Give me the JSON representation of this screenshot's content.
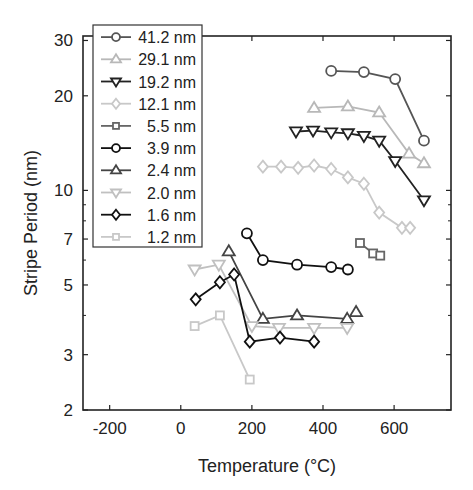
{
  "chart_data": {
    "type": "line",
    "title": "",
    "xlabel": "Temperature (°C)",
    "ylabel": "Stripe Period (nm)",
    "xlim": [
      -275,
      760
    ],
    "ylim": [
      2,
      31
    ],
    "yscale": "log",
    "xticks": [
      -200,
      0,
      200,
      400,
      600
    ],
    "yticks": [
      2,
      3,
      5,
      7,
      10,
      20,
      30
    ],
    "yminor_ticks": [
      4,
      6,
      8,
      9
    ],
    "grid": false,
    "legend_position": "upper left",
    "series": [
      {
        "name": "41.2 nm",
        "marker": "circle",
        "color": "#555555",
        "x": [
          423,
          515,
          603,
          684
        ],
        "y": [
          24.0,
          23.8,
          22.6,
          14.4
        ]
      },
      {
        "name": "29.1 nm",
        "marker": "triangle-up",
        "color": "#b8b8b8",
        "x": [
          375,
          470,
          558,
          642,
          684
        ],
        "y": [
          18.3,
          18.5,
          17.7,
          13.1,
          12.2
        ]
      },
      {
        "name": "19.2 nm",
        "marker": "triangle-down",
        "color": "#222222",
        "x": [
          324,
          372,
          423,
          470,
          515,
          558,
          603,
          684
        ],
        "y": [
          15.4,
          15.5,
          15.3,
          15.2,
          14.9,
          14.4,
          12.4,
          9.3
        ]
      },
      {
        "name": "12.1 nm",
        "marker": "diamond",
        "color": "#c8c8c8",
        "x": [
          231,
          282,
          330,
          375,
          423,
          470,
          515,
          558,
          622,
          645
        ],
        "y": [
          11.9,
          11.9,
          11.8,
          12.0,
          11.7,
          11.0,
          10.5,
          8.5,
          7.6,
          7.6
        ]
      },
      {
        "name": "5.5 nm",
        "marker": "square",
        "color": "#666666",
        "x": [
          504,
          541,
          561
        ],
        "y": [
          6.8,
          6.3,
          6.2
        ]
      },
      {
        "name": "3.9 nm",
        "marker": "circle",
        "color": "#111111",
        "x": [
          186,
          231,
          327,
          423,
          470
        ],
        "y": [
          7.3,
          6.0,
          5.8,
          5.7,
          5.6
        ]
      },
      {
        "name": "2.4 nm",
        "marker": "triangle-up",
        "color": "#444444",
        "x": [
          135,
          231,
          327,
          468,
          493
        ],
        "y": [
          6.4,
          3.9,
          4.0,
          3.9,
          4.1
        ]
      },
      {
        "name": "2.0 nm",
        "marker": "triangle-down",
        "color": "#c0c0c0",
        "x": [
          39,
          107,
          200,
          276,
          375,
          468
        ],
        "y": [
          5.6,
          5.8,
          3.7,
          3.65,
          3.65,
          3.65
        ]
      },
      {
        "name": "1.6 nm",
        "marker": "diamond",
        "color": "#111111",
        "x": [
          42,
          110,
          150,
          194,
          279,
          375
        ],
        "y": [
          4.5,
          5.1,
          5.4,
          3.3,
          3.4,
          3.3
        ]
      },
      {
        "name": "1.2 nm",
        "marker": "square",
        "color": "#c8c8c8",
        "x": [
          39,
          110,
          194
        ],
        "y": [
          3.7,
          4.0,
          2.5
        ]
      }
    ]
  },
  "layout": {
    "plot_left": 83,
    "plot_right": 451,
    "plot_top": 36,
    "plot_bottom": 410,
    "legend_box": {
      "x": 93,
      "y": 25,
      "w": 109,
      "h": 222
    }
  }
}
